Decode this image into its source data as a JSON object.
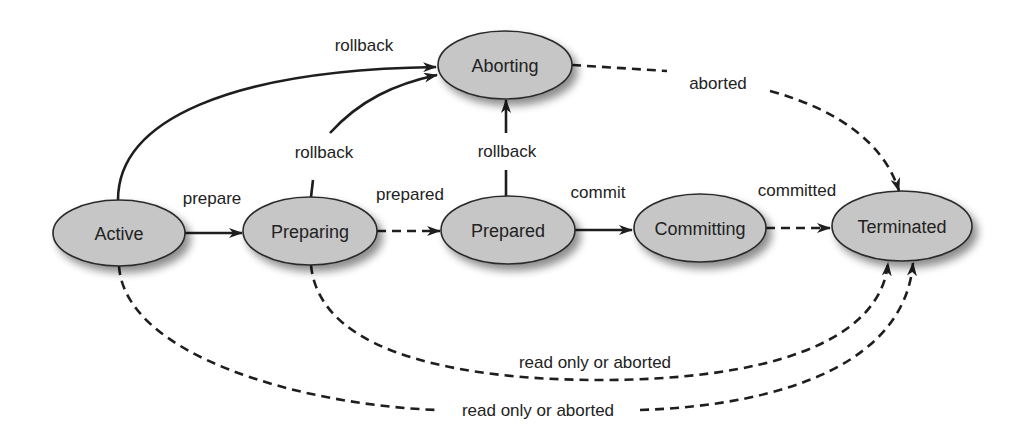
{
  "diagram": {
    "type": "state-transition",
    "colors": {
      "node_fill": "#c6c6c6",
      "node_stroke": "#2a2a2a",
      "edge": "#1e1e1e",
      "text": "#222222",
      "background": "#ffffff"
    },
    "nodes": [
      {
        "id": "active",
        "label": "Active",
        "cx": 119,
        "cy": 233,
        "rx": 66,
        "ry": 33
      },
      {
        "id": "preparing",
        "label": "Preparing",
        "cx": 310,
        "cy": 231,
        "rx": 67,
        "ry": 34
      },
      {
        "id": "prepared",
        "label": "Prepared",
        "cx": 508,
        "cy": 230,
        "rx": 67,
        "ry": 34
      },
      {
        "id": "committing",
        "label": "Committing",
        "cx": 700,
        "cy": 228,
        "rx": 66,
        "ry": 34
      },
      {
        "id": "terminated",
        "label": "Terminated",
        "cx": 902,
        "cy": 226,
        "rx": 70,
        "ry": 35
      },
      {
        "id": "aborting",
        "label": "Aborting",
        "cx": 505,
        "cy": 65,
        "rx": 67,
        "ry": 34
      }
    ],
    "edges": [
      {
        "from": "active",
        "to": "preparing",
        "label": "prepare",
        "style": "solid"
      },
      {
        "from": "preparing",
        "to": "prepared",
        "label": "prepared",
        "style": "dashed"
      },
      {
        "from": "prepared",
        "to": "committing",
        "label": "commit",
        "style": "solid"
      },
      {
        "from": "committing",
        "to": "terminated",
        "label": "committed",
        "style": "dashed"
      },
      {
        "from": "active",
        "to": "aborting",
        "label": "rollback",
        "style": "solid"
      },
      {
        "from": "preparing",
        "to": "aborting",
        "label": "rollback",
        "style": "solid"
      },
      {
        "from": "prepared",
        "to": "aborting",
        "label": "rollback",
        "style": "solid"
      },
      {
        "from": "aborting",
        "to": "terminated",
        "label": "aborted",
        "style": "dashed"
      },
      {
        "from": "preparing",
        "to": "terminated",
        "label": "read only or aborted",
        "style": "dashed"
      },
      {
        "from": "active",
        "to": "terminated",
        "label": "read only or aborted",
        "style": "dashed"
      }
    ]
  }
}
